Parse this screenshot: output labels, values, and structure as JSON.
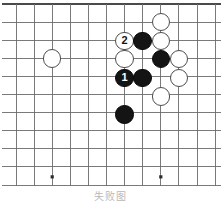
{
  "figure": {
    "kind": "go-board-diagram",
    "caption": "失败图",
    "board": {
      "columns": 12,
      "rows": 11,
      "cell_size": 18.1,
      "origin_x": 16,
      "origin_y": 4,
      "line_color": "#6b6b6b",
      "border_color": "#4a4a4a",
      "background_color": "#ffffff",
      "top_border_label": "thick-top-edge",
      "right_border_label": "thick-right-edge",
      "star_points": [
        {
          "name": "star-point-left",
          "col": 2,
          "row": 9.55
        },
        {
          "name": "star-point-right",
          "col": 8,
          "row": 9.55
        }
      ]
    },
    "stones": [
      {
        "name": "white-stone-left-side",
        "color": "white",
        "col": 2,
        "row": 3.0,
        "label": ""
      },
      {
        "name": "white-stone-top-right",
        "color": "white",
        "col": 8,
        "row": 1.0,
        "label": ""
      },
      {
        "name": "white-stone-upper-right",
        "color": "white",
        "col": 8,
        "row": 2.05,
        "label": ""
      },
      {
        "name": "white-stone-numbered-2",
        "color": "white",
        "col": 6,
        "row": 2.05,
        "label": "2"
      },
      {
        "name": "black-stone-upper",
        "color": "black",
        "col": 7,
        "row": 2.05,
        "label": ""
      },
      {
        "name": "white-stone-under-marker",
        "color": "white",
        "col": 6,
        "row": 3.05,
        "label": ""
      },
      {
        "name": "black-stone-right",
        "color": "black",
        "col": 8,
        "row": 3.05,
        "label": ""
      },
      {
        "name": "white-stone-far-right-upper",
        "color": "white",
        "col": 9,
        "row": 3.05,
        "label": ""
      },
      {
        "name": "black-stone-numbered-1",
        "color": "black",
        "col": 6,
        "row": 4.1,
        "label": "1"
      },
      {
        "name": "black-stone-beside-one",
        "color": "black",
        "col": 7,
        "row": 4.1,
        "label": ""
      },
      {
        "name": "white-stone-far-right-lower",
        "color": "white",
        "col": 9,
        "row": 4.1,
        "label": ""
      },
      {
        "name": "white-stone-lower-right",
        "color": "white",
        "col": 8,
        "row": 5.1,
        "label": ""
      },
      {
        "name": "black-stone-bottom",
        "color": "black",
        "col": 6,
        "row": 6.1,
        "label": ""
      }
    ],
    "move_markers": [
      {
        "name": "move-marker-1",
        "number": "1",
        "color": "black"
      },
      {
        "name": "move-marker-2",
        "number": "2",
        "color": "white"
      }
    ]
  }
}
